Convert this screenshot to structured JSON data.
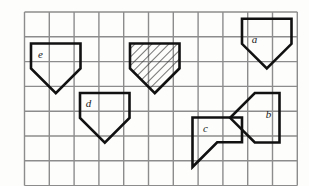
{
  "figure": {
    "background_color": "#fdfdfc",
    "grid": {
      "line_color": "#8c8c8c",
      "line_width": 1.4,
      "cell_size": 24.8,
      "origin_x": 24.5,
      "origin_y": 12.0,
      "columns": 11,
      "rows": 7,
      "visible": true
    },
    "shape_style": {
      "stroke_color": "#111111",
      "stroke_width": 2.6,
      "fill_color": "none",
      "hatch_color": "#2a2a2a"
    },
    "labels": [
      {
        "id": "a",
        "text": "a",
        "x": 254.5,
        "y": 43.0
      },
      {
        "id": "b",
        "text": "b",
        "x": 268.5,
        "y": 118.0
      },
      {
        "id": "c",
        "text": "c",
        "x": 205.5,
        "y": 131.5
      },
      {
        "id": "d",
        "text": "d",
        "x": 88.5,
        "y": 106.5
      },
      {
        "id": "e",
        "text": "e",
        "x": 40.5,
        "y": 57.5
      }
    ],
    "shapes": [
      {
        "id": "e",
        "label": "e",
        "hatched": false,
        "points": "31.0,43.5 80.5,43.5 80.5,68.5 55.8,93.2 31.0,68.5"
      },
      {
        "id": "hatched",
        "label": "",
        "hatched": true,
        "points": "130.0,43.5 179.5,43.5 179.5,68.5 154.8,93.2 130.0,68.5"
      },
      {
        "id": "a",
        "label": "a",
        "hatched": false,
        "points": "242.0,18.8 291.5,18.8 291.5,43.8 266.8,68.5 242.0,43.8"
      },
      {
        "id": "d",
        "label": "d",
        "hatched": false,
        "points": "80.0,93.0 129.5,93.0 129.5,118.0 104.8,142.7 80.0,118.0"
      },
      {
        "id": "b",
        "label": "b",
        "hatched": false,
        "points": "279.5,93.0 279.5,142.5 254.8,142.5 230.1,117.8 254.8,93.0"
      },
      {
        "id": "c",
        "label": "c",
        "hatched": false,
        "points": "192.5,117.5 192.5,167.0 217.2,142.3 242.0,142.3 242.0,117.5"
      }
    ]
  }
}
